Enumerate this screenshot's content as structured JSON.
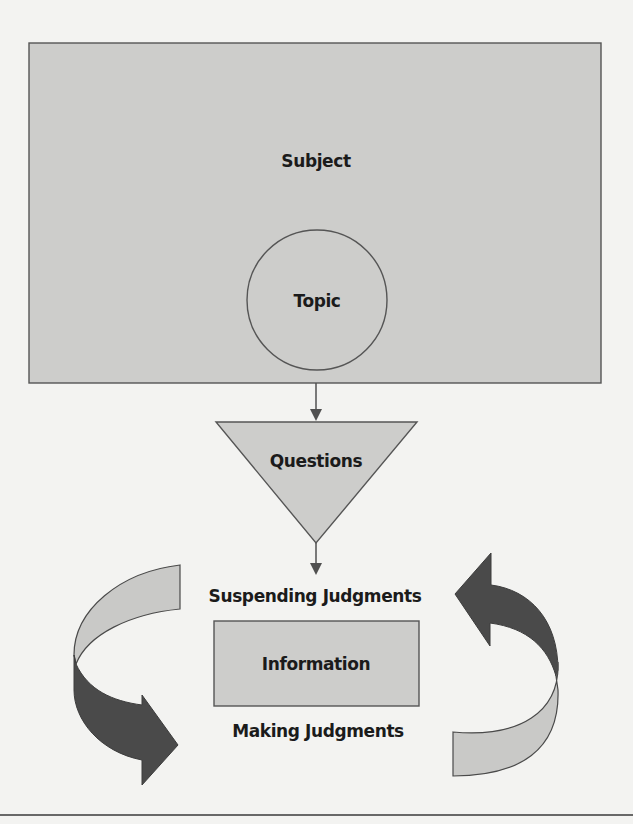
{
  "diagram": {
    "type": "concept-flow",
    "colors": {
      "background": "#f3f3f1",
      "shape_fill": "#cdcdcb",
      "stroke": "#555555",
      "dark_arrow": "#4a4a4a",
      "text": "#1b1b1b"
    },
    "nodes": {
      "subject": {
        "label": "Subject",
        "shape": "rectangle"
      },
      "topic": {
        "label": "Topic",
        "shape": "circle"
      },
      "questions": {
        "label": "Questions",
        "shape": "inverted-triangle"
      },
      "information": {
        "label": "Information",
        "shape": "rectangle"
      }
    },
    "cycle_labels": {
      "top": "Suspending Judgments",
      "bottom": "Making Judgments"
    },
    "flow": [
      "Subject",
      "Topic",
      "Questions",
      "Information"
    ],
    "cycle_arrows": [
      {
        "side": "left",
        "direction": "clockwise-down"
      },
      {
        "side": "right",
        "direction": "counterclockwise-up"
      }
    ]
  }
}
